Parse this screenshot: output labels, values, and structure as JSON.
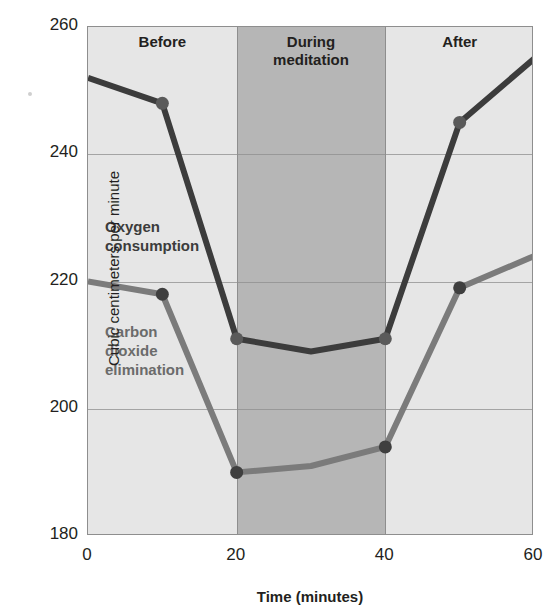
{
  "chart_data": {
    "type": "line",
    "title": "",
    "xlabel": "Time (minutes)",
    "ylabel": "Cubic centimeters per minute",
    "xlim": [
      0,
      60
    ],
    "ylim": [
      180,
      260
    ],
    "xticks": [
      "0",
      "20",
      "40",
      "60"
    ],
    "yticks": [
      "180",
      "200",
      "220",
      "240",
      "260"
    ],
    "grid": "horizontal",
    "legend_position": "inline-annotations",
    "x": [
      0,
      10,
      20,
      30,
      40,
      50,
      60
    ],
    "series": [
      {
        "name": "Oxygen consumption",
        "color": "#3c3c3c",
        "marker_color": "#5a5a5a",
        "values": [
          252,
          248,
          211,
          209,
          211,
          245,
          255
        ],
        "markers_at": [
          10,
          20,
          40,
          50
        ]
      },
      {
        "name": "Carbon dioxide elimination",
        "color": "#7b7b7b",
        "marker_color": "#3f3f3f",
        "values": [
          220,
          218,
          190,
          191,
          194,
          219,
          224
        ],
        "markers_at": [
          10,
          20,
          40,
          50
        ]
      }
    ],
    "zones": [
      {
        "label": "Before",
        "from": 0,
        "to": 20,
        "shade": "light"
      },
      {
        "label": "During meditation",
        "from": 20,
        "to": 40,
        "shade": "dark"
      },
      {
        "label": "After",
        "from": 40,
        "to": 60,
        "shade": "light"
      }
    ],
    "annotations": [
      {
        "name": "oxygen-consumption",
        "text": "Oxygen\nconsumption",
        "line1": "Oxygen",
        "line2": "consumption",
        "line3": ""
      },
      {
        "name": "carbon-dioxide",
        "text": "Carbon dioxide elimination",
        "line1": "Carbon",
        "line2": "dioxide",
        "line3": "elimination"
      }
    ],
    "colors": {
      "plot_light": "#e6e6e6",
      "plot_dark": "#b6b6b6",
      "frame": "#8e8e8e",
      "oxygen": "#3c3c3c",
      "carbon_dioxide": "#7b7b7b",
      "text": "#231f20"
    }
  }
}
